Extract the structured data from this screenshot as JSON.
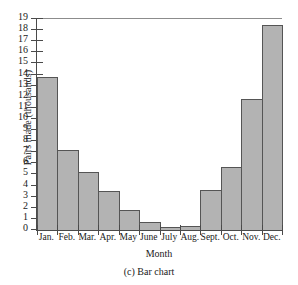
{
  "chart_data": {
    "type": "bar",
    "title": "",
    "xlabel": "Month",
    "ylabel": "Pairs made (thousands)",
    "categories": [
      "Jan.",
      "Feb.",
      "Mar.",
      "Apr.",
      "May",
      "June",
      "July",
      "Aug.",
      "Sept.",
      "Oct.",
      "Nov.",
      "Dec."
    ],
    "values": [
      13.8,
      7.2,
      5.2,
      3.5,
      1.8,
      0.75,
      0.25,
      0.4,
      3.6,
      5.7,
      11.8,
      18.5
    ],
    "ylim": [
      0,
      19
    ],
    "yticks": [
      0,
      1,
      2,
      3,
      4,
      5,
      6,
      7,
      8,
      9,
      10,
      11,
      12,
      13,
      14,
      15,
      16,
      17,
      18,
      19
    ],
    "ytick_labels": [
      "0",
      "1",
      "2",
      "3",
      "4",
      "5",
      "6",
      "7",
      "8",
      "9",
      "10",
      "11",
      "12",
      "13",
      "14",
      "15",
      "16",
      "17",
      "18",
      "19"
    ],
    "grid": false,
    "legend": null,
    "bar_fill_color": "#b3b3b3",
    "bar_edge_color": "#555555",
    "axis_color": "#4a4a4a"
  },
  "caption": "(c) Bar chart"
}
